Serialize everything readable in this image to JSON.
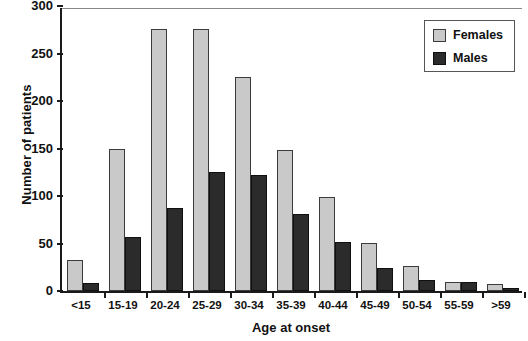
{
  "chart_data": {
    "type": "bar",
    "title": "",
    "xlabel": "Age at onset",
    "ylabel": "Number of patients",
    "categories": [
      "<15",
      "15-19",
      "20-24",
      "25-29",
      "30-34",
      "35-39",
      "40-44",
      "45-49",
      "50-54",
      "55-59",
      ">59"
    ],
    "series": [
      {
        "name": "Females",
        "color": "#c9c9c9",
        "values": [
          33,
          150,
          276,
          276,
          225,
          148,
          99,
          51,
          26,
          10,
          7
        ]
      },
      {
        "name": "Males",
        "color": "#2b2b2b",
        "values": [
          8,
          57,
          87,
          125,
          122,
          81,
          52,
          24,
          12,
          10,
          3
        ]
      }
    ],
    "ylim": [
      0,
      300
    ],
    "yticks": [
      0,
      50,
      100,
      150,
      200,
      250,
      300
    ],
    "ytick_labels": [
      "0",
      "50",
      "100",
      "150",
      "200",
      "250",
      "300"
    ],
    "grid": false,
    "legend_position": "top-right"
  },
  "legend": {
    "entries": [
      {
        "label": "Females",
        "swatch": "female"
      },
      {
        "label": "Males",
        "swatch": "male"
      }
    ]
  },
  "axes": {
    "y_title": "Number of patients",
    "x_title": "Age at onset"
  }
}
